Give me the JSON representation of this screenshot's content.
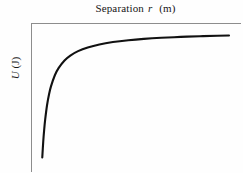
{
  "figure": {
    "background_color": "#fefefe",
    "axis_color": "#8d8d8d",
    "curve_color": "#111111"
  },
  "axes": {
    "x_title_prefix": "Separation",
    "x_title_symbol": "r",
    "x_title_unit": "(m)",
    "y_title_symbol": "U",
    "y_title_unit": "(J)"
  },
  "chart_data": {
    "type": "line",
    "title": "Separation r (m)",
    "xlabel": "Separation r (m)",
    "ylabel": "U (J)",
    "grid": false,
    "legend": null,
    "axis_style": {
      "left_spine": true,
      "top_spine": true,
      "right_spine": false,
      "bottom_spine": false,
      "ticks": false,
      "tick_labels": false
    },
    "xlim": [
      0,
      1
    ],
    "ylim": [
      -1,
      0
    ],
    "series": [
      {
        "name": "U(r)",
        "x": [
          0.035,
          0.04,
          0.045,
          0.05,
          0.06,
          0.07,
          0.08,
          0.1,
          0.12,
          0.15,
          0.18,
          0.22,
          0.27,
          0.33,
          0.4,
          0.48,
          0.56,
          0.65,
          0.75,
          0.85,
          0.94,
          1.0
        ],
        "y": [
          -1.0,
          -0.875,
          -0.778,
          -0.7,
          -0.583,
          -0.5,
          -0.438,
          -0.35,
          -0.292,
          -0.233,
          -0.194,
          -0.159,
          -0.13,
          -0.106,
          -0.0875,
          -0.073,
          -0.0625,
          -0.0538,
          -0.0467,
          -0.0412,
          -0.0372,
          -0.035
        ]
      }
    ]
  }
}
